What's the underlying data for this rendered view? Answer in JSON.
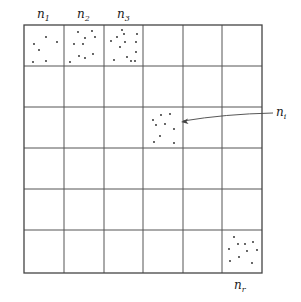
{
  "diagram": {
    "grid": {
      "rows": 6,
      "cols": 6,
      "x_lines": [
        24,
        64,
        104,
        143,
        183,
        222,
        262
      ],
      "y_lines": [
        25,
        66,
        107,
        148,
        189,
        230,
        273
      ]
    },
    "labels": {
      "n1": {
        "base": "n",
        "sub": "1"
      },
      "n2": {
        "base": "n",
        "sub": "2"
      },
      "n3": {
        "base": "n",
        "sub": "3"
      },
      "ni": {
        "base": "n",
        "sub": "i"
      },
      "nr": {
        "base": "n",
        "sub": "r"
      }
    },
    "cells": [
      {
        "name": "cell-n1",
        "row": 0,
        "col": 0,
        "dots": [
          [
            46,
            37
          ],
          [
            57,
            42
          ],
          [
            34,
            44
          ],
          [
            39,
            50
          ],
          [
            33,
            62
          ],
          [
            46,
            61
          ]
        ]
      },
      {
        "name": "cell-n2",
        "row": 0,
        "col": 1,
        "dots": [
          [
            78,
            32
          ],
          [
            92,
            31
          ],
          [
            85,
            38
          ],
          [
            95,
            37
          ],
          [
            74,
            44
          ],
          [
            83,
            44
          ],
          [
            79,
            56
          ],
          [
            93,
            54
          ],
          [
            85,
            58
          ],
          [
            70,
            62
          ]
        ]
      },
      {
        "name": "cell-n3",
        "row": 0,
        "col": 2,
        "dots": [
          [
            122,
            30
          ],
          [
            124,
            34
          ],
          [
            137,
            34
          ],
          [
            117,
            37
          ],
          [
            125,
            42
          ],
          [
            136,
            42
          ],
          [
            111,
            41
          ],
          [
            120,
            47
          ],
          [
            136,
            52
          ],
          [
            127,
            57
          ],
          [
            114,
            60
          ],
          [
            131,
            61
          ],
          [
            135,
            61
          ]
        ]
      },
      {
        "name": "cell-ni",
        "row": 2,
        "col": 3,
        "dots": [
          [
            153,
            120
          ],
          [
            161,
            115
          ],
          [
            170,
            114
          ],
          [
            156,
            125
          ],
          [
            165,
            124
          ],
          [
            174,
            129
          ],
          [
            160,
            136
          ],
          [
            154,
            142
          ],
          [
            174,
            143
          ]
        ]
      },
      {
        "name": "cell-nr",
        "row": 5,
        "col": 5,
        "dots": [
          [
            234,
            237
          ],
          [
            238,
            244
          ],
          [
            245,
            244
          ],
          [
            253,
            242
          ],
          [
            229,
            249
          ],
          [
            247,
            251
          ],
          [
            257,
            250
          ],
          [
            239,
            257
          ],
          [
            230,
            261
          ],
          [
            252,
            263
          ]
        ]
      }
    ],
    "arrow": {
      "from": [
        273,
        113
      ],
      "to": [
        181,
        122
      ],
      "label": "ni"
    }
  }
}
